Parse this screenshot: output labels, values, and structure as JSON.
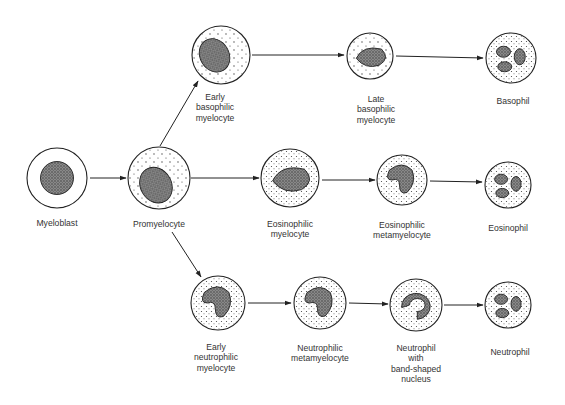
{
  "diagram": {
    "colors": {
      "stroke": "#222222",
      "nucleus": "#555555",
      "background": "#ffffff"
    },
    "cells": [
      {
        "id": "myeloblast",
        "label": "Myeloblast",
        "cx": 57,
        "cy": 178,
        "r": 30,
        "lx": 57,
        "ly": 218
      },
      {
        "id": "promyelocyte",
        "label": "Promyelocyte",
        "cx": 159,
        "cy": 178,
        "r": 31,
        "lx": 159,
        "ly": 219
      },
      {
        "id": "early-basophilic-myelocyte",
        "label": "Early\nbasophilic\nmyelocyte",
        "cx": 221,
        "cy": 55,
        "r": 29,
        "lx": 215,
        "ly": 92
      },
      {
        "id": "late-basophilic-myelocyte",
        "label": "Late\nbasophilic\nmyelocyte",
        "cx": 370,
        "cy": 56,
        "r": 23,
        "lx": 376,
        "ly": 94
      },
      {
        "id": "basophil",
        "label": "Basophil",
        "cx": 511,
        "cy": 58,
        "r": 25,
        "lx": 513,
        "ly": 96
      },
      {
        "id": "eosinophilic-myelocyte",
        "label": "Eosinophilic\nmyelocyte",
        "cx": 290,
        "cy": 178,
        "r": 29,
        "lx": 290,
        "ly": 219
      },
      {
        "id": "eosinophilic-metamyelocyte",
        "label": "Eosinophilic\nmetamyelocyte",
        "cx": 402,
        "cy": 180,
        "r": 25,
        "lx": 402,
        "ly": 220
      },
      {
        "id": "eosinophil",
        "label": "Eosinophil",
        "cx": 508,
        "cy": 185,
        "r": 23,
        "lx": 508,
        "ly": 223
      },
      {
        "id": "early-neutrophilic-myelocyte",
        "label": "Early\nneutrophilic\nmyelocyte",
        "cx": 218,
        "cy": 303,
        "r": 27,
        "lx": 216,
        "ly": 342
      },
      {
        "id": "neutrophilic-metamyelocyte",
        "label": "Neutrophilic\nmetamyelocyte",
        "cx": 320,
        "cy": 303,
        "r": 26,
        "lx": 320,
        "ly": 343
      },
      {
        "id": "neutrophil-band",
        "label": "Neutrophil\nwith\nband-shaped\nnucleus",
        "cx": 416,
        "cy": 305,
        "r": 26,
        "lx": 416,
        "ly": 343
      },
      {
        "id": "neutrophil",
        "label": "Neutrophil",
        "cx": 508,
        "cy": 305,
        "r": 23,
        "lx": 510,
        "ly": 347
      }
    ],
    "arrows": [
      {
        "from": "myeloblast",
        "to": "promyelocyte",
        "x1": 90,
        "y1": 178,
        "x2": 126,
        "y2": 178
      },
      {
        "from": "promyelocyte",
        "to": "early-basophilic-myelocyte",
        "x1": 160,
        "y1": 146,
        "x2": 198,
        "y2": 81
      },
      {
        "from": "promyelocyte",
        "to": "eosinophilic-myelocyte",
        "x1": 191,
        "y1": 178,
        "x2": 259,
        "y2": 178
      },
      {
        "from": "promyelocyte",
        "to": "early-neutrophilic-myelocyte",
        "x1": 172,
        "y1": 232,
        "x2": 201,
        "y2": 277
      },
      {
        "from": "early-basophilic-myelocyte",
        "to": "late-basophilic-myelocyte",
        "x1": 252,
        "y1": 55,
        "x2": 344,
        "y2": 55
      },
      {
        "from": "late-basophilic-myelocyte",
        "to": "basophil",
        "x1": 396,
        "y1": 56,
        "x2": 483,
        "y2": 58
      },
      {
        "from": "eosinophilic-myelocyte",
        "to": "eosinophilic-metamyelocyte",
        "x1": 322,
        "y1": 180,
        "x2": 375,
        "y2": 180
      },
      {
        "from": "eosinophilic-metamyelocyte",
        "to": "eosinophil",
        "x1": 430,
        "y1": 181,
        "x2": 482,
        "y2": 182
      },
      {
        "from": "early-neutrophilic-myelocyte",
        "to": "neutrophilic-metamyelocyte",
        "x1": 248,
        "y1": 303,
        "x2": 291,
        "y2": 303
      },
      {
        "from": "neutrophilic-metamyelocyte",
        "to": "neutrophil-band",
        "x1": 349,
        "y1": 303,
        "x2": 388,
        "y2": 304
      },
      {
        "from": "neutrophil-band",
        "to": "neutrophil",
        "x1": 444,
        "y1": 305,
        "x2": 483,
        "y2": 305
      }
    ]
  }
}
